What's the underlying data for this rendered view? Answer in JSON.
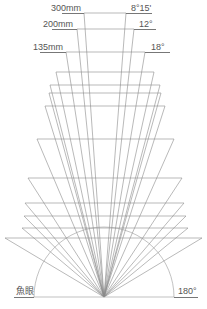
{
  "labels": {
    "focal_300": "300mm",
    "focal_200": "200mm",
    "focal_135": "135mm",
    "angle_300": "8°15'",
    "angle_200": "12°",
    "angle_135": "18°",
    "fisheye": "魚眼",
    "angle_180": "180°"
  },
  "colors": {
    "line": "#8a8a8a",
    "text": "#555555",
    "background": "#ffffff"
  },
  "diagram": {
    "apex": [
      104,
      297
    ],
    "arc_radius": 70,
    "horizontal_lines": [
      {
        "y": 13,
        "x1": 84,
        "x2": 126
      },
      {
        "y": 29,
        "x1": 77,
        "x2": 134
      },
      {
        "y": 52,
        "x1": 66,
        "x2": 145
      },
      {
        "y": 72,
        "x1": 56,
        "x2": 154
      },
      {
        "y": 85,
        "x1": 50,
        "x2": 160
      },
      {
        "y": 93,
        "x1": 49,
        "x2": 161
      },
      {
        "y": 106,
        "x1": 45,
        "x2": 165
      },
      {
        "y": 139,
        "x1": 37,
        "x2": 174
      },
      {
        "y": 178,
        "x1": 28,
        "x2": 182
      },
      {
        "y": 203,
        "x1": 25,
        "x2": 184
      },
      {
        "y": 216,
        "x1": 24,
        "x2": 186
      },
      {
        "y": 228,
        "x1": 22,
        "x2": 188
      },
      {
        "y": 238,
        "x1": 5,
        "x2": 202
      }
    ]
  }
}
